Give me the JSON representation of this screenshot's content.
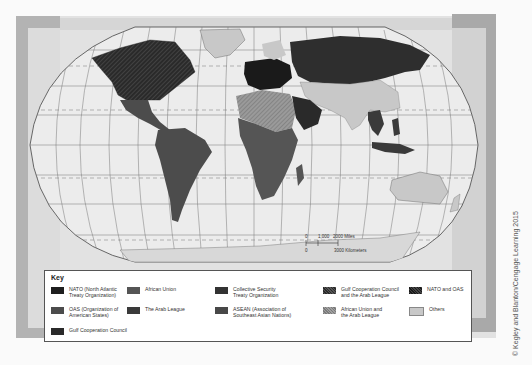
{
  "map": {
    "projection": "Robinson-style world map",
    "colors": {
      "background": "#e6e6e6",
      "ocean": "#ececec",
      "grid": "#666666",
      "nato": "#1e1e1e",
      "oas": "#4c4c4c",
      "gcc": "#2a2a2a",
      "african_union": "#555555",
      "arab_league": "#3a3a3a",
      "csto": "#333333",
      "asean": "#484848",
      "gcc_arab_league": "#383838",
      "au_arab_league": "#8a8a8a",
      "nato_oas": "#2e2e2e",
      "others": "#c8c8c8"
    },
    "scale_bar": {
      "zero_top": "0",
      "miles_mid": "1,000",
      "miles_label": "2000 Miles",
      "zero_bottom": "0",
      "km_label": "3000 Kilometers"
    }
  },
  "legend": {
    "title": "Key",
    "items": [
      {
        "label": "NATO (North Atlantic\nTreaty Organization)",
        "color": "#1e1e1e",
        "pattern": "solid"
      },
      {
        "label": "OAS (Organization of\nAmerican States)",
        "color": "#4c4c4c",
        "pattern": "solid"
      },
      {
        "label": "Gulf Cooperation Council",
        "color": "#2a2a2a",
        "pattern": "solid"
      },
      {
        "label": "African Union",
        "color": "#555555",
        "pattern": "solid"
      },
      {
        "label": "The Arab League",
        "color": "#3a3a3a",
        "pattern": "solid"
      },
      {
        "label": "Collective Security\nTreaty Organization",
        "color": "#333333",
        "pattern": "solid"
      },
      {
        "label": "ASEAN (Association of\nSoutheast Asian Nations)",
        "color": "#484848",
        "pattern": "solid"
      },
      {
        "label": "Gulf Cooperation Council\nand the Arab League",
        "color": "#383838",
        "pattern": "hatch"
      },
      {
        "label": "African Union and\nthe Arab League",
        "color": "#8a8a8a",
        "pattern": "hatch"
      },
      {
        "label": "NATO and OAS",
        "color": "#2e2e2e",
        "pattern": "hatch"
      },
      {
        "label": "Others",
        "color": "#c8c8c8",
        "pattern": "solid"
      }
    ]
  },
  "credit": "© Kegley and Blanton/Cengage Learning 2015"
}
